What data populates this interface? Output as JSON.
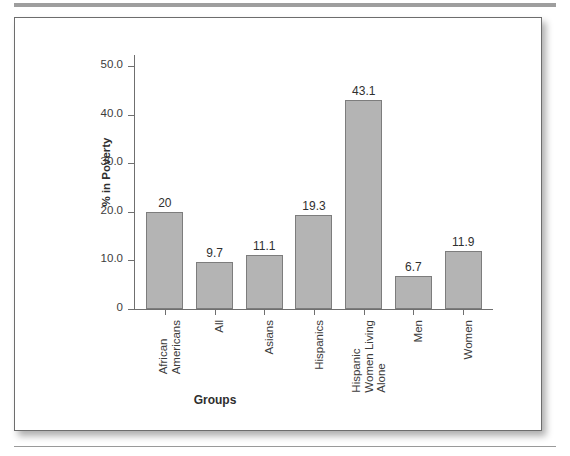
{
  "figure": {
    "y_axis_title": "% in Poverty",
    "x_axis_title": "Groups"
  },
  "chart_data": {
    "type": "bar",
    "title": "",
    "xlabel": "Groups",
    "ylabel": "% in Poverty",
    "ylim": [
      0,
      55
    ],
    "grid": false,
    "legend": "none",
    "bar_color": "#b4b4b4",
    "bar_border_color": "#7d7d7d",
    "ytick_labels": [
      "0",
      "10.0",
      "20.0",
      "30.0",
      "40.0",
      "50.0"
    ],
    "ytick_values": [
      0,
      10,
      20,
      30,
      40,
      50
    ],
    "categories": [
      "African Americans",
      "All",
      "Asians",
      "Hispanics",
      "Hispanic Women Living Alone",
      "Men",
      "Women"
    ],
    "category_lines": [
      [
        "African",
        "Americans"
      ],
      [
        "All"
      ],
      [
        "Asians"
      ],
      [
        "Hispanics"
      ],
      [
        "Hispanic",
        "Women Living",
        "Alone"
      ],
      [
        "Men"
      ],
      [
        "Women"
      ]
    ],
    "values": [
      20,
      9.7,
      11.1,
      19.3,
      43.1,
      6.7,
      11.9
    ],
    "value_labels": [
      "20",
      "9.7",
      "11.1",
      "19.3",
      "43.1",
      "6.7",
      "11.9"
    ]
  }
}
